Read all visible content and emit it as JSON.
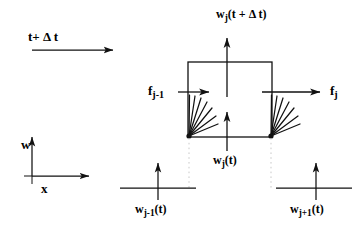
{
  "figure": {
    "kind": "finite-volume-flux-diagram",
    "stroke_color": "#111111",
    "dotted_color": "#c8c8c8",
    "background": "#ffffff",
    "width": 364,
    "height": 240
  },
  "labels": {
    "time_step": {
      "text": "t+ Δ t",
      "plain": "t+ delta t"
    },
    "w_top": {
      "base": "w",
      "subscript": "j",
      "arg": "(t + Δ t)"
    },
    "flux_left": {
      "base": "f",
      "subscript": "j-1"
    },
    "flux_right": {
      "base": "f",
      "subscript": "j"
    },
    "w_center": {
      "base": "w",
      "subscript": "j",
      "arg": "(t)"
    },
    "w_left": {
      "base": "w",
      "subscript": "j-1",
      "arg": "(t)"
    },
    "w_right": {
      "base": "w",
      "subscript": "j+1",
      "arg": "(t)"
    },
    "axis_vertical": "w",
    "axis_horizontal": "x"
  },
  "geometry": {
    "cell_box": {
      "x": 188,
      "y": 62,
      "width": 84,
      "height": 75
    },
    "top_arrow": {
      "x": 227,
      "y_from": 96,
      "y_to": 37
    },
    "center_arrow": {
      "x": 227,
      "y_from": 152,
      "y_to": 112
    },
    "time_arrow": {
      "x_from": 32,
      "x_to": 118,
      "y": 50
    },
    "flux_arrow_left": {
      "x_from": 178,
      "x_to": 212,
      "y": 92
    },
    "flux_arrow_right": {
      "x_from": 262,
      "x_to": 322,
      "y": 92
    },
    "fan_left_origin": {
      "x": 189,
      "y": 136
    },
    "fan_right_origin": {
      "x": 271,
      "y": 136
    },
    "fan_ray_count": 7,
    "dotted_drop_left": {
      "x": 189,
      "y_from": 137,
      "y_to": 188
    },
    "dotted_drop_right": {
      "x": 271,
      "y_from": 137,
      "y_to": 188
    },
    "axes": {
      "origin_x": 32,
      "origin_y": 176,
      "x_tip": 92,
      "y_tip": 136
    },
    "node_left": {
      "x_from": 120,
      "x_to": 196,
      "y": 188,
      "arrow_x": 158,
      "arrow_top": 162
    },
    "node_right": {
      "x_from": 276,
      "x_to": 352,
      "y": 188,
      "arrow_x": 316,
      "arrow_top": 162
    }
  }
}
